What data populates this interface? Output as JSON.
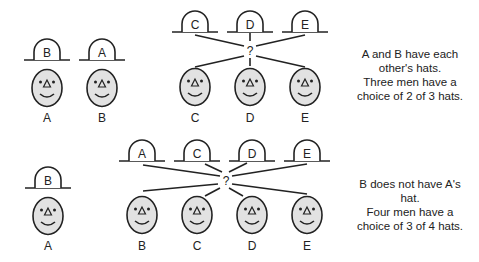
{
  "colors": {
    "stroke": "#222222",
    "face_fill": "#e2e2e2",
    "text": "#222222"
  },
  "top": {
    "left_hats": [
      {
        "label": "B",
        "cx": 47,
        "brim_y": 60
      },
      {
        "label": "A",
        "cx": 102,
        "brim_y": 60
      }
    ],
    "left_men": [
      {
        "label": "A",
        "cx": 47
      },
      {
        "label": "B",
        "cx": 102
      }
    ],
    "choice_hats": [
      {
        "label": "C",
        "cx": 195
      },
      {
        "label": "D",
        "cx": 250
      },
      {
        "label": "E",
        "cx": 305
      }
    ],
    "choice_men": [
      {
        "label": "C",
        "cx": 195
      },
      {
        "label": "D",
        "cx": 250
      },
      {
        "label": "E",
        "cx": 305
      }
    ],
    "question_mark": "?",
    "caption": [
      "A and B have each",
      "other's hats.",
      "Three men have a",
      "choice of 2 of 3 hats."
    ]
  },
  "bottom": {
    "left_hats": [
      {
        "label": "B",
        "cx": 47
      }
    ],
    "left_men": [
      {
        "label": "A",
        "cx": 47
      }
    ],
    "choice_hats": [
      {
        "label": "A",
        "cx": 142
      },
      {
        "label": "C",
        "cx": 197
      },
      {
        "label": "D",
        "cx": 252
      },
      {
        "label": "E",
        "cx": 307
      }
    ],
    "choice_men": [
      {
        "label": "B",
        "cx": 142
      },
      {
        "label": "C",
        "cx": 197
      },
      {
        "label": "D",
        "cx": 252
      },
      {
        "label": "E",
        "cx": 307
      }
    ],
    "question_mark": "?",
    "caption": [
      "B does not have A's",
      "hat.",
      "Four men have a",
      "choice of 3 of 4 hats."
    ]
  }
}
